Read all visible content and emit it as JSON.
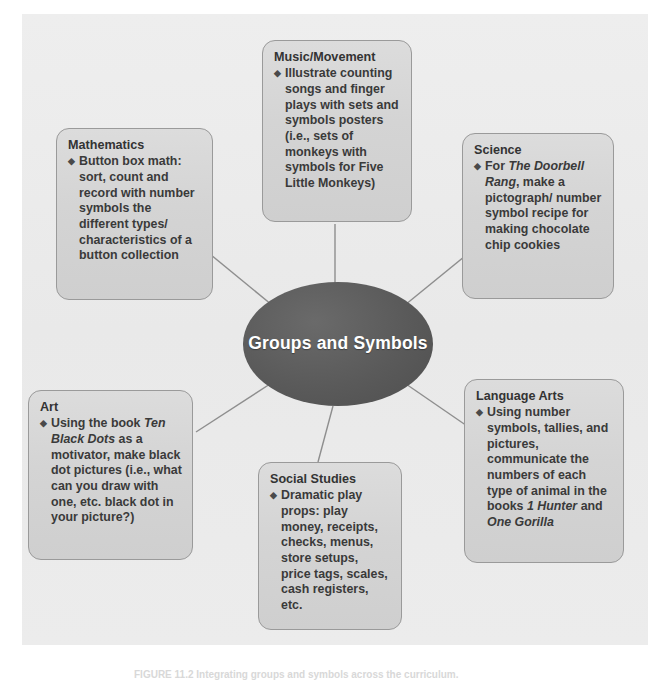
{
  "figure": {
    "center": {
      "label": "Groups and\nSymbols",
      "shape": "ellipse",
      "fill_color": "#5b5b5b",
      "text_color": "#ffffff"
    },
    "caption": "FIGURE 11.2  Integrating groups and symbols across the curriculum.",
    "panel_color": "#ebebeb",
    "node_fill_color": "#d6d6d6",
    "node_border_color": "#9a9a9a",
    "connector_color": "#8e8e8e",
    "bullet_glyph": "◆",
    "nodes": [
      {
        "id": "music-movement",
        "title": "Music/Movement",
        "bullet": "◆",
        "text": "Illustrate counting songs and finger plays with sets and symbols posters (i.e., sets of monkeys with symbols for Five Little Monkeys)"
      },
      {
        "id": "mathematics",
        "title": "Mathematics",
        "bullet": "◆",
        "text": "Button box math: sort, count and record with number symbols the different types/ characteristics of a button collection"
      },
      {
        "id": "science",
        "title": "Science",
        "bullet": "◆",
        "text": "For The Doorbell Rang, make a pictograph/ number symbol recipe for making chocolate chip cookies",
        "italic_terms": [
          "The Doorbell Rang"
        ]
      },
      {
        "id": "language-arts",
        "title": "Language Arts",
        "bullet": "◆",
        "text": "Using number symbols, tallies, and pictures, communicate the numbers of each type of animal in the books 1 Hunter and One Gorilla",
        "italic_terms": [
          "1 Hunter",
          "One Gorilla"
        ]
      },
      {
        "id": "social-studies",
        "title": "Social Studies",
        "bullet": "◆",
        "text": "Dramatic play props: play money, receipts, checks, menus, store setups, price tags, scales, cash registers, etc."
      },
      {
        "id": "art",
        "title": "Art",
        "bullet": "◆",
        "text": "Using the book Ten Black Dots as a motivator, make black dot pictures (i.e., what can you draw with one, etc. black dot in your picture?)",
        "italic_terms": [
          "Ten Black Dots"
        ]
      }
    ]
  }
}
